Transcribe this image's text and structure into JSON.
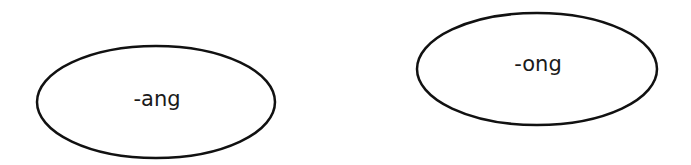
{
  "diagram": {
    "nodes": [
      {
        "id": "ang",
        "label": "-ang",
        "shape": "ellipse",
        "cx": 156,
        "cy": 102,
        "rx": 119,
        "ry": 56
      },
      {
        "id": "ong",
        "label": "-ong",
        "shape": "ellipse",
        "cx": 537,
        "cy": 69,
        "rx": 120,
        "ry": 56
      }
    ],
    "colors": {
      "stroke": "#111111",
      "background": "#ffffff",
      "text": "#1a1a1a"
    }
  }
}
